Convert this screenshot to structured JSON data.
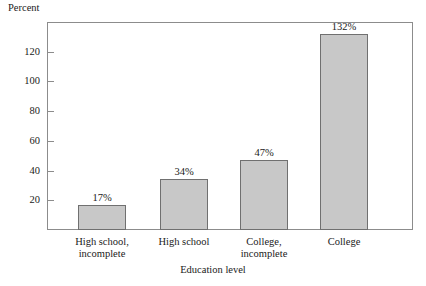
{
  "chart_data": {
    "type": "bar",
    "title": "",
    "ylabel": "Percent",
    "xlabel": "Education level",
    "categories": [
      "High school,\nincomplete",
      "High school",
      "College,\nincomplete",
      "College"
    ],
    "values": [
      17,
      34,
      47,
      132
    ],
    "value_labels": [
      "17%",
      "34%",
      "47%",
      "132%"
    ],
    "ylim": [
      0,
      140
    ],
    "yticks": [
      20,
      40,
      60,
      80,
      100,
      120
    ],
    "ytick_labels": [
      "20",
      "40",
      "60",
      "80",
      "100",
      "120"
    ],
    "grid": false,
    "legend": "none",
    "colors": {
      "bar_fill": "#c8c8c8",
      "bar_border": "#707070",
      "frame": "#8c8c8c",
      "text": "#1a1a1a",
      "background": "#ffffff"
    }
  }
}
